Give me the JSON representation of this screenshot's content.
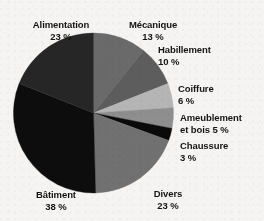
{
  "chart_data": {
    "type": "pie",
    "title": "",
    "subtitle": "",
    "xlabel": "",
    "ylabel": "",
    "legend_position": "around-slices",
    "grid": false,
    "units": "%",
    "categories": [
      "Mécanique",
      "Habillement",
      "Coiffure",
      "Ameublement et bois",
      "Chaussure",
      "Divers",
      "Bâtiment",
      "Alimentation"
    ],
    "values": [
      13,
      10,
      6,
      5,
      3,
      23,
      38,
      23
    ],
    "slices": [
      {
        "name": "Mécanique",
        "value": 13,
        "value_text": "13 %",
        "color": "#6a6a6a",
        "label_name": "Mécanique",
        "label_value": "13 %"
      },
      {
        "name": "Habillement",
        "value": 10,
        "value_text": "10 %",
        "color": "#5d5d5d",
        "label_name": "Habillement",
        "label_value": "10 %"
      },
      {
        "name": "Coiffure",
        "value": 6,
        "value_text": "6 %",
        "color": "#b5b5b5",
        "label_name": "Coiffure",
        "label_value": "6 %"
      },
      {
        "name": "Ameublement et bois",
        "value": 5,
        "value_text": "5 %",
        "color": "#8e8e8e",
        "label_name": "Ameublement",
        "label_value": "et bois  5 %"
      },
      {
        "name": "Chaussure",
        "value": 3,
        "value_text": "3 %",
        "color": "#0a0a0a",
        "label_name": "Chaussure",
        "label_value": "3 %"
      },
      {
        "name": "Divers",
        "value": 23,
        "value_text": "23 %",
        "color": "#717171",
        "label_name": "Divers",
        "label_value": "23 %"
      },
      {
        "name": "Bâtiment",
        "value": 38,
        "value_text": "38 %",
        "color": "#0d0d0d",
        "label_name": "Bâtiment",
        "label_value": "38 %"
      },
      {
        "name": "Alimentation",
        "value": 23,
        "value_text": "23 %",
        "color": "#262626",
        "label_name": "Alimentation",
        "label_value": "23 %"
      }
    ]
  },
  "colors": {
    "background": "#f5f4f2",
    "text": "#141414",
    "slice_black": "#0d0d0d",
    "slice_dark": "#262626",
    "slice_mid_dark": "#5d5d5d",
    "slice_mid": "#6a6a6a",
    "slice_mid_light": "#8e8e8e",
    "slice_light": "#b5b5b5"
  },
  "geometry": {
    "center_x": 93.5,
    "center_y": 113,
    "radius": 80,
    "start_angle_deg": -90
  }
}
